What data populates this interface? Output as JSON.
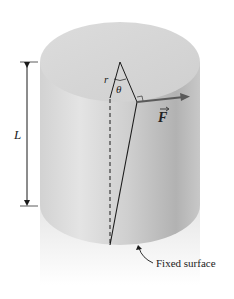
{
  "figure": {
    "type": "torsion-cylinder",
    "labels": {
      "radius": "r",
      "angle": "θ",
      "force": "F",
      "length": "L",
      "fixed_surface": "Fixed surface"
    },
    "colors": {
      "background": "#ffffff",
      "top_face": "#d6d6d6",
      "side_light": "#e2e2e2",
      "side_dark": "#b4b4b4",
      "line": "#1a1a1a",
      "force_arrow": "#5a5a5a"
    }
  }
}
